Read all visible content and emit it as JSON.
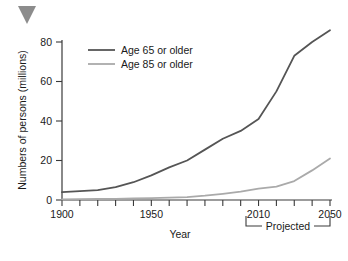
{
  "marker": {
    "name": "triangle-marker",
    "color": "#8c8c8c",
    "direction": "down"
  },
  "chart_data": {
    "type": "line",
    "title": "",
    "xlabel": "Year",
    "ylabel": "Numbers of persons (millions)",
    "xlim": [
      1900,
      2050
    ],
    "ylim": [
      0,
      80
    ],
    "yticks": [
      0,
      20,
      40,
      60,
      80
    ],
    "ytick_labels": [
      "0",
      "20",
      "40",
      "60",
      "80"
    ],
    "xticks": [
      1900,
      1910,
      1920,
      1930,
      1940,
      1950,
      1960,
      1970,
      1980,
      1990,
      2000,
      2010,
      2020,
      2030,
      2040,
      2050
    ],
    "xtick_labels_shown": [
      "1900",
      "1950",
      "2010",
      "2050"
    ],
    "xtick_labels_positions": [
      1900,
      1950,
      2010,
      2050
    ],
    "grid": false,
    "legend_position": "upper-left-inside",
    "annotations": [
      {
        "name": "projected-bracket",
        "text": "Projected",
        "from": 2010,
        "to": 2050
      }
    ],
    "series": [
      {
        "name": "Age 65 or older",
        "color": "#555555",
        "x": [
          1900,
          1910,
          1920,
          1930,
          1940,
          1950,
          1960,
          1970,
          1980,
          1990,
          2000,
          2010,
          2020,
          2030,
          2040,
          2050
        ],
        "values": [
          4,
          4.5,
          5,
          6.5,
          9,
          12.5,
          16.5,
          20,
          25.5,
          31,
          35,
          41,
          55,
          73,
          80,
          86
        ]
      },
      {
        "name": "Age 85 or older",
        "color": "#aaaaaa",
        "x": [
          1900,
          1910,
          1920,
          1930,
          1940,
          1950,
          1960,
          1970,
          1980,
          1990,
          2000,
          2010,
          2020,
          2030,
          2040,
          2050
        ],
        "values": [
          0.3,
          0.4,
          0.5,
          0.6,
          0.8,
          1,
          1.2,
          1.5,
          2.2,
          3.1,
          4.2,
          5.8,
          6.8,
          9.6,
          15,
          21
        ]
      }
    ]
  },
  "legend": {
    "entries": [
      {
        "label": "Age 65 or older",
        "color": "#555555"
      },
      {
        "label": "Age 85 or older",
        "color": "#aaaaaa"
      }
    ]
  },
  "axis": {
    "x_title": "Year",
    "y_title": "Numbers of persons (millions)"
  },
  "projected": {
    "label": "Projected"
  }
}
